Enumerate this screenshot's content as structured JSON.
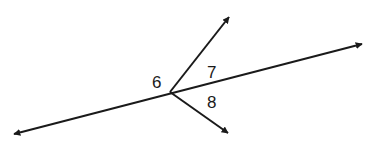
{
  "diagram": {
    "type": "geometry-angles",
    "stroke_color": "#1a1a1a",
    "background": "#ffffff",
    "intersection": {
      "x": 170,
      "y": 92
    },
    "line": {
      "name": "transversal-line",
      "start": {
        "x": 14,
        "y": 134
      },
      "end": {
        "x": 362,
        "y": 44
      },
      "arrows": "both"
    },
    "rays": [
      {
        "name": "upper-ray",
        "start": {
          "x": 170,
          "y": 92
        },
        "end": {
          "x": 229,
          "y": 17
        }
      },
      {
        "name": "lower-ray",
        "start": {
          "x": 170,
          "y": 92
        },
        "end": {
          "x": 228,
          "y": 133
        }
      }
    ],
    "labels": [
      {
        "id": "angle-6",
        "text": "6",
        "x": 152,
        "y": 88
      },
      {
        "id": "angle-7",
        "text": "7",
        "x": 207,
        "y": 78
      },
      {
        "id": "angle-8",
        "text": "8",
        "x": 207,
        "y": 108
      }
    ]
  }
}
